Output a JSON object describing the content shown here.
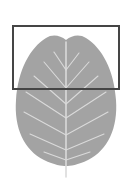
{
  "figure": {
    "leaf_color": "#a3a3a3",
    "vein_color": "#dadada",
    "background": "#ffffff"
  },
  "selection_box": {
    "x": 12,
    "y": 25,
    "width": 108,
    "height": 65,
    "border_color": "#454545"
  }
}
